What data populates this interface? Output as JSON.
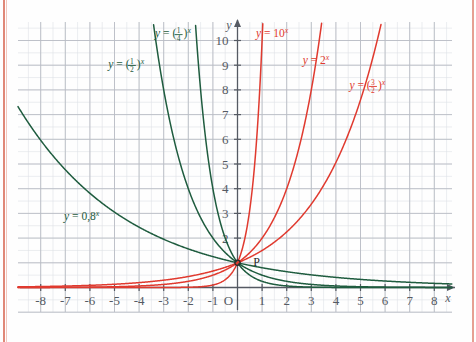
{
  "figure": {
    "point_label": "P",
    "axis_labels": {
      "x": "x",
      "y": "y"
    },
    "origin_label": "O"
  },
  "colors": {
    "decay_curve": "#1f5c3f",
    "growth_curve": "#e03a2f",
    "grid_major": "#b9bcc4",
    "grid_minor": "#dde0e5",
    "axis": "#555a63",
    "page_edge": "#e08878",
    "background": "#fefefe"
  },
  "chart_data": {
    "type": "line",
    "title": "",
    "xlabel": "x",
    "ylabel": "y",
    "xlim": [
      -8.6,
      8.8
    ],
    "ylim": [
      -0.7,
      10.8
    ],
    "grid": true,
    "legend": "inline-annotations",
    "xticks": [
      -8,
      -7,
      -6,
      -5,
      -4,
      -3,
      -2,
      -1,
      1,
      2,
      3,
      4,
      5,
      6,
      7,
      8
    ],
    "xticklabels": [
      "-8",
      "-7",
      "-6",
      "-5",
      "-4",
      "-3",
      "-2",
      "-1",
      "1",
      "2",
      "3",
      "4",
      "5",
      "6",
      "7",
      "8"
    ],
    "yticks": [
      1,
      2,
      3,
      4,
      5,
      6,
      7,
      8,
      9,
      10
    ],
    "yticklabels": [
      "",
      "2",
      "3",
      "4",
      "5",
      "6",
      "7",
      "8",
      "9",
      "10"
    ],
    "common_point": {
      "x": 0,
      "y": 1,
      "label": "P"
    },
    "series": [
      {
        "name": "y = (1/4)^x",
        "base": 0.25,
        "color": "#1f5c3f",
        "annotation": "y = (¼)ˣ",
        "annotation_numerator": "1",
        "annotation_denominator": "4",
        "annotation_pos": {
          "x": -3.35,
          "y": 10.15
        }
      },
      {
        "name": "y = (1/2)^x",
        "base": 0.5,
        "color": "#1f5c3f",
        "annotation": "y = (½)ˣ",
        "annotation_numerator": "1",
        "annotation_denominator": "2",
        "annotation_pos": {
          "x": -5.25,
          "y": 8.9
        }
      },
      {
        "name": "y = 0,8^x",
        "base": 0.8,
        "color": "#1f5c3f",
        "annotation": "y = 0,8ˣ",
        "annotation_pos": {
          "x": -7.05,
          "y": 2.75
        }
      },
      {
        "name": "y = (3/2)^x",
        "base": 1.5,
        "color": "#e03a2f",
        "annotation": "y = (3/2)ˣ",
        "annotation_numerator": "3",
        "annotation_denominator": "2",
        "annotation_pos": {
          "x": 4.55,
          "y": 8.05
        }
      },
      {
        "name": "y = 2^x",
        "base": 2,
        "color": "#e03a2f",
        "annotation": "y = 2ˣ",
        "annotation_pos": {
          "x": 2.65,
          "y": 9.05
        }
      },
      {
        "name": "y = 10^x",
        "base": 10,
        "color": "#e03a2f",
        "annotation": "y = 10ˣ",
        "annotation_pos": {
          "x": 0.75,
          "y": 10.15
        }
      }
    ]
  }
}
